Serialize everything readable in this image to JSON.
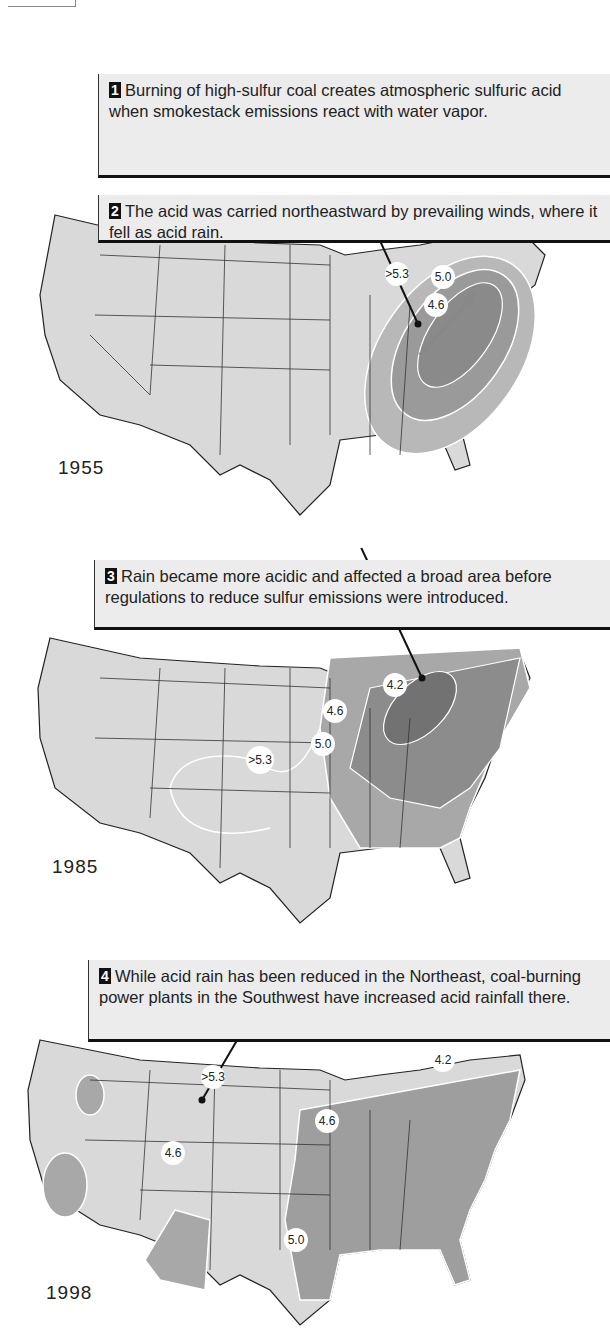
{
  "panels": [
    {
      "step": "1",
      "text": "Burning of high-sulfur coal creates atmospheric sulfuric acid when smokestack emissions react with water vapor.",
      "year": "",
      "labels": []
    },
    {
      "step": "2",
      "text": "The acid was carried northeastward by prevailing winds, where it fell as acid rain.",
      "year": "1955",
      "labels": [
        ">5.3",
        "5.0",
        "4.6"
      ]
    },
    {
      "step": "3",
      "text": "Rain became more acidic and affected a broad area before regulations to reduce sulfur emissions were introduced.",
      "year": "1985",
      "labels": [
        "4.2",
        "4.6",
        "5.0",
        ">5.3"
      ]
    },
    {
      "step": "4",
      "text": "While acid rain has been reduced in the Northeast, coal-burning power plants in the Southwest have increased acid rainfall there.",
      "year": "1998",
      "labels": [
        ">5.3",
        "4.2",
        "4.6",
        "4.6",
        "5.0"
      ]
    }
  ],
  "colors": {
    "land": "#d9d9d9",
    "shade_light": "#b8b8b8",
    "shade_mid": "#9a9a9a",
    "shade_dark": "#7e7e7e",
    "callout_bg": "#ececec",
    "contour": "#ffffff"
  }
}
